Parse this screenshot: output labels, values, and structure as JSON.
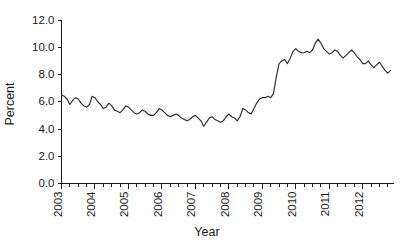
{
  "chart_data": {
    "type": "line",
    "title": "",
    "xlabel": "Year",
    "ylabel": "Percent",
    "ylim": [
      0.0,
      12.0
    ],
    "ytick_step": 2.0,
    "ytick_labels": [
      "0.0",
      "2.0",
      "4.0",
      "6.0",
      "8.0",
      "10.0",
      "12.0"
    ],
    "ytick_values": [
      0.0,
      2.0,
      4.0,
      6.0,
      8.0,
      10.0,
      12.0
    ],
    "xtick_labels": [
      "2003",
      "2004",
      "2005",
      "2006",
      "2007",
      "2008",
      "2009",
      "2010",
      "2011",
      "2012"
    ],
    "xtick_values": [
      2003,
      2004,
      2005,
      2006,
      2007,
      2008,
      2009,
      2010,
      2011,
      2012
    ],
    "x_minor_ticks_per_year": 4,
    "xlim": [
      2003.0,
      2012.92
    ],
    "grid": false,
    "legend": false,
    "legend_position": "none",
    "line_color": "#2b2b2b",
    "series": [
      {
        "name": "Unemployment rate",
        "x": [
          2003.0,
          2003.083,
          2003.167,
          2003.25,
          2003.333,
          2003.417,
          2003.5,
          2003.583,
          2003.667,
          2003.75,
          2003.833,
          2003.917,
          2004.0,
          2004.083,
          2004.167,
          2004.25,
          2004.333,
          2004.417,
          2004.5,
          2004.583,
          2004.667,
          2004.75,
          2004.833,
          2004.917,
          2005.0,
          2005.083,
          2005.167,
          2005.25,
          2005.333,
          2005.417,
          2005.5,
          2005.583,
          2005.667,
          2005.75,
          2005.833,
          2005.917,
          2006.0,
          2006.083,
          2006.167,
          2006.25,
          2006.333,
          2006.417,
          2006.5,
          2006.583,
          2006.667,
          2006.75,
          2006.833,
          2006.917,
          2007.0,
          2007.083,
          2007.167,
          2007.25,
          2007.333,
          2007.417,
          2007.5,
          2007.583,
          2007.667,
          2007.75,
          2007.833,
          2007.917,
          2008.0,
          2008.083,
          2008.167,
          2008.25,
          2008.333,
          2008.417,
          2008.5,
          2008.583,
          2008.667,
          2008.75,
          2008.833,
          2008.917,
          2009.0,
          2009.083,
          2009.167,
          2009.25,
          2009.333,
          2009.417,
          2009.5,
          2009.583,
          2009.667,
          2009.75,
          2009.833,
          2009.917,
          2010.0,
          2010.083,
          2010.167,
          2010.25,
          2010.333,
          2010.417,
          2010.5,
          2010.583,
          2010.667,
          2010.75,
          2010.833,
          2010.917,
          2011.0,
          2011.083,
          2011.167,
          2011.25,
          2011.333,
          2011.417,
          2011.5,
          2011.583,
          2011.667,
          2011.75,
          2011.833,
          2011.917,
          2012.0,
          2012.083,
          2012.167,
          2012.25,
          2012.333,
          2012.417,
          2012.5,
          2012.583,
          2012.667,
          2012.75,
          2012.833
        ],
        "values": [
          6.5,
          6.4,
          6.2,
          5.8,
          6.1,
          6.3,
          6.2,
          5.9,
          5.7,
          5.6,
          5.8,
          6.4,
          6.3,
          6.0,
          5.8,
          5.5,
          5.6,
          5.9,
          5.7,
          5.4,
          5.3,
          5.2,
          5.4,
          5.7,
          5.6,
          5.4,
          5.2,
          5.1,
          5.2,
          5.4,
          5.3,
          5.1,
          5.0,
          5.0,
          5.2,
          5.5,
          5.4,
          5.2,
          5.0,
          4.9,
          5.0,
          5.1,
          5.0,
          4.8,
          4.7,
          4.6,
          4.7,
          4.9,
          5.0,
          4.8,
          4.6,
          4.2,
          4.5,
          4.8,
          4.9,
          4.7,
          4.6,
          4.5,
          4.6,
          4.9,
          5.1,
          4.9,
          4.8,
          4.6,
          4.9,
          5.5,
          5.4,
          5.2,
          5.1,
          5.5,
          5.9,
          6.2,
          6.3,
          6.3,
          6.4,
          6.3,
          6.6,
          7.8,
          8.8,
          9.0,
          9.1,
          8.8,
          9.2,
          9.7,
          9.9,
          9.7,
          9.6,
          9.6,
          9.7,
          9.6,
          9.8,
          10.3,
          10.6,
          10.3,
          9.9,
          9.7,
          9.5,
          9.6,
          9.8,
          9.7,
          9.4,
          9.2,
          9.4,
          9.6,
          9.8,
          9.6,
          9.3,
          9.1,
          8.8,
          8.8,
          9.0,
          8.7,
          8.5,
          8.7,
          8.9,
          8.6,
          8.3,
          8.1,
          8.3
        ]
      }
    ]
  },
  "axis": {
    "y_title": "Percent",
    "x_title": "Year"
  }
}
